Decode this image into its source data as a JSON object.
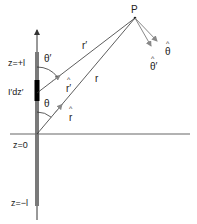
{
  "diagram": {
    "title": "",
    "labels": {
      "point": "P",
      "z_top": "z=+l",
      "z_origin": "z=0",
      "z_bottom": "z=−l",
      "current_element": "I′dz′",
      "theta_prime": "θ′",
      "theta": "θ",
      "r_prime": "r′",
      "r": "r",
      "r_prime_hat": "r′",
      "r_hat": "r",
      "theta_hat": "θ",
      "theta_prime_hat": "θ′",
      "hat_mark": "^"
    },
    "colors": {
      "line": "#333333",
      "rod": "#7a7a7a",
      "element": "#000000",
      "axis": "#666666",
      "unit_vector": "#888888"
    }
  }
}
